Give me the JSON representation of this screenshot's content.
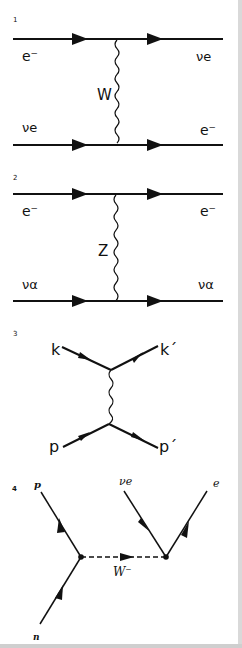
{
  "diagrams": [
    {
      "number": "1",
      "particles": {
        "top_in": "e⁻",
        "top_out": "νe",
        "bottom_in": "νe",
        "bottom_out": "e⁻",
        "boson": "W"
      }
    },
    {
      "number": "2",
      "particles": {
        "top_in": "e⁻",
        "top_out": "e⁻",
        "bottom_in": "να",
        "bottom_out": "να",
        "boson": "Z"
      }
    },
    {
      "number": "3",
      "particles": {
        "top_in": "k",
        "top_out": "k´",
        "bottom_in": "p",
        "bottom_out": "p´"
      }
    },
    {
      "number": "4",
      "particles": {
        "left_in": "n",
        "left_out": "p",
        "right_in": "νe",
        "right_out": "e",
        "boson": "W⁻"
      }
    }
  ],
  "colors": {
    "line": "#111111",
    "background": "#ffffff",
    "border": "#d9d9d9"
  }
}
